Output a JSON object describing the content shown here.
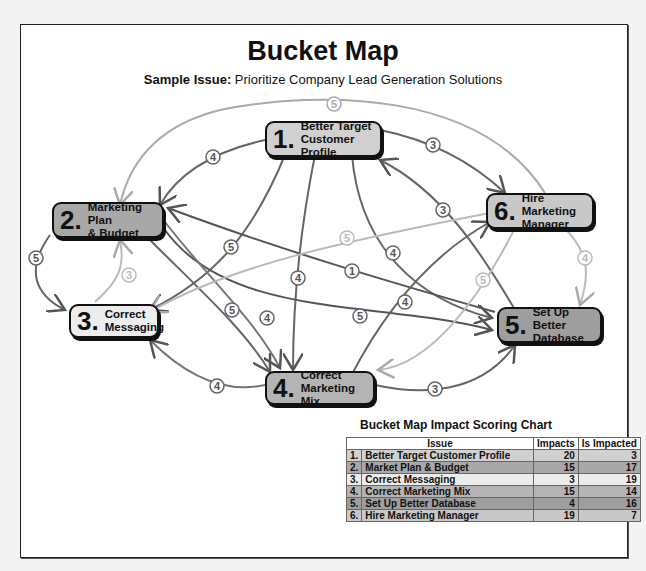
{
  "title": "Bucket Map",
  "subtitle": {
    "label": "Sample Issue:",
    "text": "Prioritize Company Lead Generation Solutions"
  },
  "nodes": [
    {
      "id": 1,
      "num": "1.",
      "line1": "Better Target",
      "line2": "Customer Profile",
      "color": "#d0d0d0"
    },
    {
      "id": 2,
      "num": "2.",
      "line1": "Marketing Plan",
      "line2": "& Budget",
      "color": "#a8a8a8"
    },
    {
      "id": 3,
      "num": "3.",
      "line1": "Correct",
      "line2": "Messaging",
      "color": "#ececec"
    },
    {
      "id": 4,
      "num": "4.",
      "line1": "Correct",
      "line2": "Marketing Mix",
      "color": "#b4b4b4"
    },
    {
      "id": 5,
      "num": "5.",
      "line1": "Set Up Better",
      "line2": "Database",
      "color": "#9e9e9e"
    },
    {
      "id": 6,
      "num": "6.",
      "line1": "Hire Marketing",
      "line2": "Manager",
      "color": "#c8c8c8"
    }
  ],
  "edges": [
    {
      "from": 1,
      "to": 2,
      "weight": "4"
    },
    {
      "from": 1,
      "to": 6,
      "weight": "3"
    },
    {
      "from": 6,
      "to": 2,
      "weight": "5"
    },
    {
      "from": 2,
      "to": 3,
      "weight": "5"
    },
    {
      "from": 3,
      "to": 2,
      "weight": "3"
    },
    {
      "from": 1,
      "to": 3,
      "weight": "5"
    },
    {
      "from": 1,
      "to": 4,
      "weight": "4"
    },
    {
      "from": 1,
      "to": 5,
      "weight": "4"
    },
    {
      "from": 5,
      "to": 1,
      "weight": "3"
    },
    {
      "from": 5,
      "to": 2,
      "weight": "1"
    },
    {
      "from": 2,
      "to": 5,
      "weight": "5"
    },
    {
      "from": 2,
      "to": 4,
      "weight": "5"
    },
    {
      "from": 2,
      "to": 4,
      "weight": "4"
    },
    {
      "from": 6,
      "to": 3,
      "weight": "5"
    },
    {
      "from": 6,
      "to": 5,
      "weight": "4"
    },
    {
      "from": 4,
      "to": 6,
      "weight": "4"
    },
    {
      "from": 4,
      "to": 3,
      "weight": "4"
    },
    {
      "from": 4,
      "to": 5,
      "weight": "3"
    },
    {
      "from": 5,
      "to": 4,
      "weight": "5"
    }
  ],
  "scoring_chart": {
    "title": "Bucket Map Impact Scoring Chart",
    "headers": [
      "Issue",
      "Impacts",
      "Is Impacted"
    ],
    "rows": [
      {
        "idx": "1.",
        "issue": "Better Target Customer Profile",
        "impacts": "20",
        "is_impacted": "3",
        "color": "#d0d0d0"
      },
      {
        "idx": "2.",
        "issue": "Market Plan & Budget",
        "impacts": "15",
        "is_impacted": "17",
        "color": "#a8a8a8"
      },
      {
        "idx": "3.",
        "issue": "Correct Messaging",
        "impacts": "3",
        "is_impacted": "19",
        "color": "#ececec"
      },
      {
        "idx": "4.",
        "issue": "Correct Marketing Mix",
        "impacts": "15",
        "is_impacted": "14",
        "color": "#b4b4b4"
      },
      {
        "idx": "5.",
        "issue": "Set Up Better Database",
        "impacts": "4",
        "is_impacted": "16",
        "color": "#9e9e9e"
      },
      {
        "idx": "6.",
        "issue": "Hire Marketing Manager",
        "impacts": "19",
        "is_impacted": "7",
        "color": "#c8c8c8"
      }
    ]
  }
}
